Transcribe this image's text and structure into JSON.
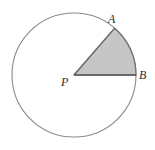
{
  "figure": {
    "type": "geometry-diagram",
    "background_color": "#ffffff",
    "width": 155,
    "height": 150
  },
  "circle": {
    "name": "circle-P",
    "center_x": 74,
    "center_y": 75,
    "radius": 62,
    "stroke_color": "#8a8a8a",
    "stroke_width": 1.1,
    "fill_color": "#ffffff"
  },
  "sector": {
    "name": "shaded-sector-APB",
    "fill_color": "#c6c6c6",
    "stroke_color": "#6e6e6e",
    "stroke_width": 1.2,
    "start_angle_deg": 0,
    "end_angle_deg": 49,
    "arc_from": "B",
    "arc_to": "A"
  },
  "radii": [
    {
      "name": "radius-PA",
      "from": "P",
      "to": "A",
      "stroke_color": "#6e6e6e",
      "stroke_width": 1.2
    },
    {
      "name": "radius-PB",
      "from": "P",
      "to": "B",
      "stroke_color": "#555555",
      "stroke_width": 1.4
    }
  ],
  "points": [
    {
      "id": "A",
      "label": "A",
      "x": 114.7,
      "y": 28.2,
      "label_x": 108,
      "label_y": 13
    },
    {
      "id": "B",
      "label": "B",
      "x": 136.0,
      "y": 75.0,
      "label_x": 139,
      "label_y": 69
    },
    {
      "id": "P",
      "label": "P",
      "x": 74.0,
      "y": 75.0,
      "label_x": 61,
      "label_y": 76
    }
  ],
  "labels": {
    "point_a": "A",
    "point_b": "B",
    "point_p": "P"
  }
}
